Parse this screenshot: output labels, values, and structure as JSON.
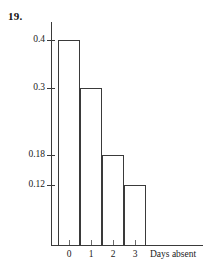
{
  "problem": {
    "number": "19."
  },
  "chart_data": {
    "type": "bar",
    "title": "",
    "subtitle": "",
    "xlabel": "Days absent",
    "ylabel": "",
    "categories": [
      "0",
      "1",
      "2",
      "3"
    ],
    "values": [
      0.4,
      0.3,
      0.18,
      0.12
    ],
    "ytick_labels": [
      "0.4",
      "0.3",
      "0.18",
      "0.12"
    ],
    "ytick_values": [
      0.4,
      0.3,
      0.18,
      0.12
    ],
    "xtick_labels": [
      "0",
      "1",
      "2",
      "3"
    ],
    "grid": false,
    "legend": null,
    "ylim": [
      0,
      0.4
    ],
    "bar_style": "outline",
    "note": "relative frequency histogram of days absent"
  },
  "axis": {
    "y_tick_pixels": [
      40,
      88,
      155,
      185
    ],
    "baseline_pixel": 245,
    "bar_left_pixels": [
      58,
      80,
      102,
      124
    ],
    "bar_width": 22
  },
  "colors": {
    "stroke": "#3a3a3a",
    "text": "#1a1a1a",
    "background": "#ffffff"
  }
}
